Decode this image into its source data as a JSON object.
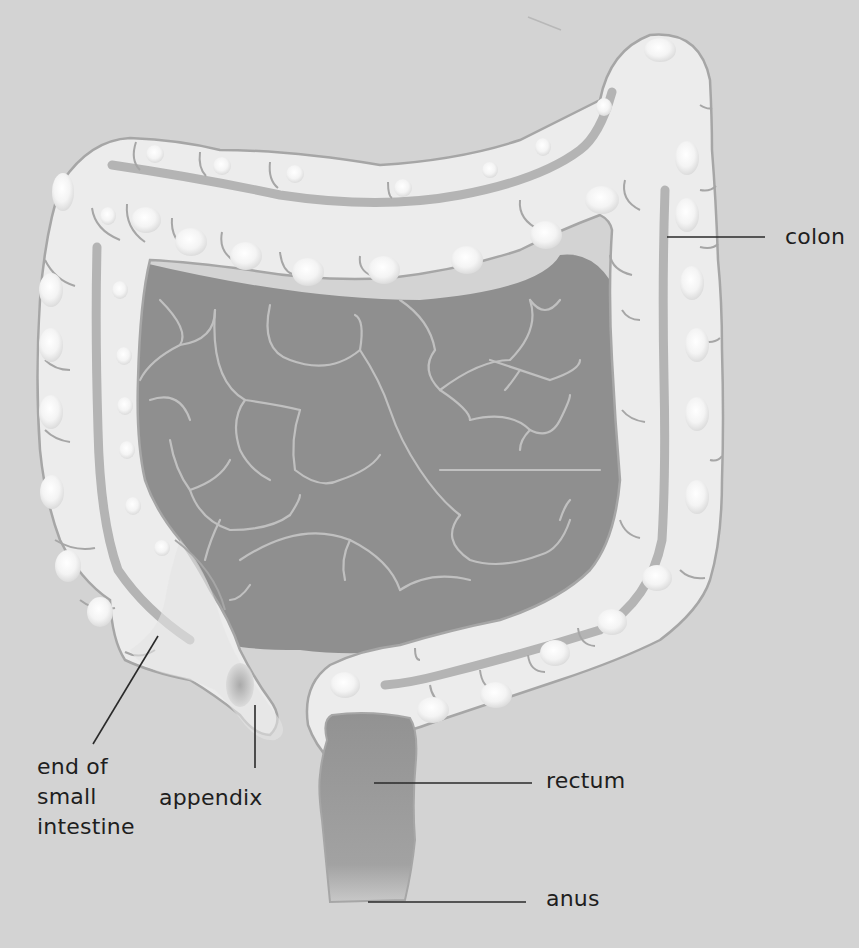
{
  "diagram": {
    "colors": {
      "background": "#d3d3d3",
      "colon_fill": "#ececec",
      "colon_outline": "#a6a6a6",
      "taenia_band": "#b4b4b4",
      "small_intestine": "#8f8f8f",
      "small_intestine_lines": "#c0c0c0",
      "rectum": "#9b9b9b",
      "leader_line": "#2a2a2a",
      "label_text": "#1e1e1e"
    },
    "labels": {
      "colon": "colon",
      "end_of_small_intestine": "end of\nsmall\nintestine",
      "appendix": "appendix",
      "rectum": "rectum",
      "anus": "anus"
    }
  }
}
